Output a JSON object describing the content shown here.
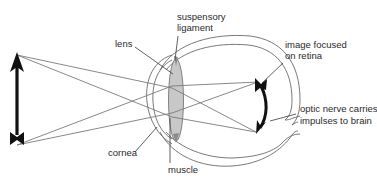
{
  "diagram": {
    "labels": {
      "lens": "lens",
      "suspensory_ligament_line1": "suspensory",
      "suspensory_ligament_line2": "ligament",
      "image_focused_line1": "image focused",
      "image_focused_line2": "on retina",
      "optic_nerve_line1": "optic nerve carries",
      "optic_nerve_line2": "impulses to brain",
      "cornea": "cornea",
      "muscle": "muscle"
    },
    "elements": {
      "object": "upright arrow (object)",
      "image": "inverted arrow on retina (image)",
      "rays": "light rays from object through lens to retina"
    },
    "colors": {
      "ink": "#111111",
      "outline": "#6a6a6a",
      "ray": "#7a7a7a",
      "lens_fill": "#c8c8c8",
      "text": "#2a2a2a"
    }
  }
}
